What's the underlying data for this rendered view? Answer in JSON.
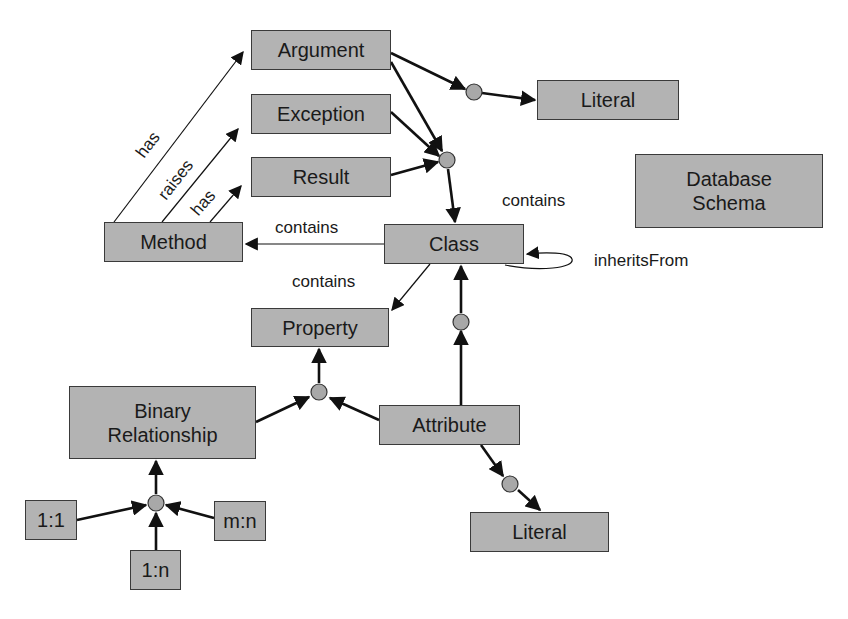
{
  "diagram": {
    "title": "Database Schema",
    "colors": {
      "node_fill": "#b3b3b3",
      "node_border": "#3a3a3a",
      "edge": "#111111",
      "junction": "#a8a8a8"
    },
    "nodes": {
      "argument": "Argument",
      "exception": "Exception",
      "result": "Result",
      "literal_top": "Literal",
      "database_schema": "Database\nSchema",
      "method": "Method",
      "class": "Class",
      "property": "Property",
      "binary_relationship": "Binary\nRelationship",
      "attribute": "Attribute",
      "literal_bottom": "Literal",
      "one_to_one": "1:1",
      "many_to_many": "m:n",
      "one_to_many": "1:n"
    },
    "edge_labels": {
      "method_has_argument": "has",
      "method_raises_exception": "raises",
      "method_has_result": "has",
      "class_contains_method": "contains",
      "class_contains_members": "contains",
      "class_contains_property": "contains",
      "class_inherits_from": "inheritsFrom"
    },
    "edges": [
      {
        "from": "Method",
        "to": "Argument",
        "label": "has"
      },
      {
        "from": "Method",
        "to": "Exception",
        "label": "raises"
      },
      {
        "from": "Method",
        "to": "Result",
        "label": "has"
      },
      {
        "from": "Argument",
        "to": "Literal (top)",
        "via": "junction"
      },
      {
        "from": "Argument",
        "to": "Class",
        "via": "junction"
      },
      {
        "from": "Exception",
        "to": "Class",
        "via": "junction"
      },
      {
        "from": "Result",
        "to": "Class",
        "via": "junction"
      },
      {
        "from": "Class",
        "to": "Method",
        "label": "contains"
      },
      {
        "from": "Class",
        "to": "Property",
        "label": "contains"
      },
      {
        "from": "Class",
        "to": "Class",
        "label": "inheritsFrom"
      },
      {
        "from": "Attribute",
        "to": "Class",
        "via": "junction"
      },
      {
        "from": "Attribute",
        "to": "Property",
        "via": "junction"
      },
      {
        "from": "Binary Relationship",
        "to": "Property",
        "via": "junction"
      },
      {
        "from": "Attribute",
        "to": "Literal (bottom)",
        "via": "junction"
      },
      {
        "from": "1:1",
        "to": "Binary Relationship",
        "via": "junction"
      },
      {
        "from": "m:n",
        "to": "Binary Relationship",
        "via": "junction"
      },
      {
        "from": "1:n",
        "to": "Binary Relationship",
        "via": "junction"
      }
    ]
  }
}
